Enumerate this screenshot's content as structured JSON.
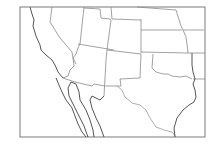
{
  "map": {
    "type": "outline map",
    "region": "Southwestern United States and northern Mexico",
    "style": {
      "background": "#ffffff",
      "frame_color": "#7a7a7a",
      "border_color": "#8a8a8a",
      "coast_color": "#555555"
    },
    "labels": []
  }
}
